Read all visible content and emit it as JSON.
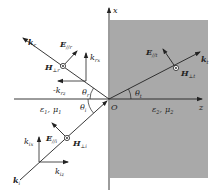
{
  "diagram": {
    "colors": {
      "medium2_fill": "#a9a9a9",
      "line": "#222222",
      "background": "#ffffff"
    },
    "axes": {
      "x_label": "x",
      "z_label": "z",
      "origin_label": "O"
    },
    "media": {
      "medium1": {
        "eps": "ε",
        "eps_sub": "1",
        "mu": "μ",
        "mu_sub": "1",
        "sep": ","
      },
      "medium2": {
        "eps": "ε",
        "eps_sub": "2",
        "mu": "μ",
        "mu_sub": "2",
        "sep": ","
      }
    },
    "angles": {
      "incident": {
        "symbol": "θ",
        "sub": "i"
      },
      "reflected": {
        "symbol": "θ",
        "sub": "r"
      },
      "transmitted": {
        "symbol": "θ",
        "sub": "t"
      }
    },
    "incident_wave": {
      "k": {
        "symbol": "k",
        "sub": "i"
      },
      "E": {
        "symbol": "E",
        "sub": "//i"
      },
      "H": {
        "symbol": "H",
        "sub": "⊥i"
      },
      "kix": {
        "symbol": "k",
        "sub": "ix"
      },
      "kiz": {
        "symbol": "k",
        "sub": "iz"
      }
    },
    "reflected_wave": {
      "k": {
        "symbol": "k",
        "sub": "r"
      },
      "E": {
        "symbol": "E",
        "sub": "//r"
      },
      "H": {
        "symbol": "H",
        "sub": "⊥r"
      },
      "krx": {
        "symbol": "k",
        "sub": "rx"
      },
      "minus_krz": {
        "symbol": "-k",
        "sub": "rz"
      }
    },
    "transmitted_wave": {
      "k": {
        "symbol": "k",
        "sub": "t"
      },
      "E": {
        "symbol": "E",
        "sub": "//t"
      },
      "H": {
        "symbol": "H",
        "sub": "⊥t"
      }
    },
    "icons": {
      "out_of_page": "circled-dot-icon"
    }
  }
}
